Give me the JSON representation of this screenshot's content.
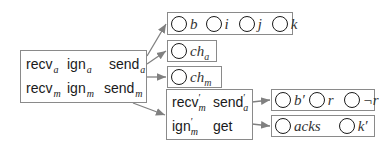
{
  "source_box": {
    "rows": [
      [
        {
          "base": "recv",
          "sub": "a"
        },
        {
          "base": "ign",
          "sub": "a"
        },
        {
          "base": "send",
          "sub": "a"
        }
      ],
      [
        {
          "base": "recv",
          "sub": "m"
        },
        {
          "base": "ign",
          "sub": "m"
        },
        {
          "base": "send",
          "sub": "m"
        }
      ]
    ]
  },
  "middle_box": {
    "rows": [
      [
        {
          "base": "recv",
          "prime": "′",
          "sub": "m"
        },
        {
          "base": "send",
          "prime": "′",
          "sub": "a"
        }
      ],
      [
        {
          "base": "ign",
          "prime": "′",
          "sub": "m"
        },
        {
          "base": "get",
          "prime": "",
          "sub": ""
        }
      ]
    ]
  },
  "targets": {
    "top": [
      {
        "base": "b",
        "sub": ""
      },
      {
        "base": "i",
        "sub": ""
      },
      {
        "base": "j",
        "sub": ""
      },
      {
        "base": "k",
        "sub": ""
      }
    ],
    "ch_a": [
      {
        "base": "ch",
        "sub": "a"
      }
    ],
    "ch_m": [
      {
        "base": "ch",
        "sub": "m"
      }
    ],
    "right1": [
      {
        "base": "b′",
        "sub": ""
      },
      {
        "base": "r",
        "sub": ""
      },
      {
        "base": "¬r",
        "sub": ""
      }
    ],
    "right2": [
      {
        "base": "acks",
        "sub": ""
      },
      {
        "base": "k′",
        "sub": ""
      }
    ]
  },
  "colors": {
    "border": "#8a8a8a",
    "arrow": "#808080",
    "circle": "#1a1a1a",
    "text": "#1a1a1a"
  }
}
